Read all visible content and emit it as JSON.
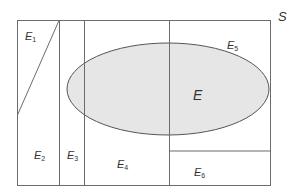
{
  "diagram": {
    "sample_space_label": "S",
    "event_label": "E",
    "partitions": [
      {
        "name": "E",
        "sub": "1"
      },
      {
        "name": "E",
        "sub": "2"
      },
      {
        "name": "E",
        "sub": "3"
      },
      {
        "name": "E",
        "sub": "4"
      },
      {
        "name": "E",
        "sub": "5"
      },
      {
        "name": "E",
        "sub": "6"
      }
    ],
    "colors": {
      "line": "#6b6b6b",
      "ellipse_fill": "#e6e6e6",
      "ellipse_stroke": "#555555",
      "text": "#333333"
    }
  }
}
